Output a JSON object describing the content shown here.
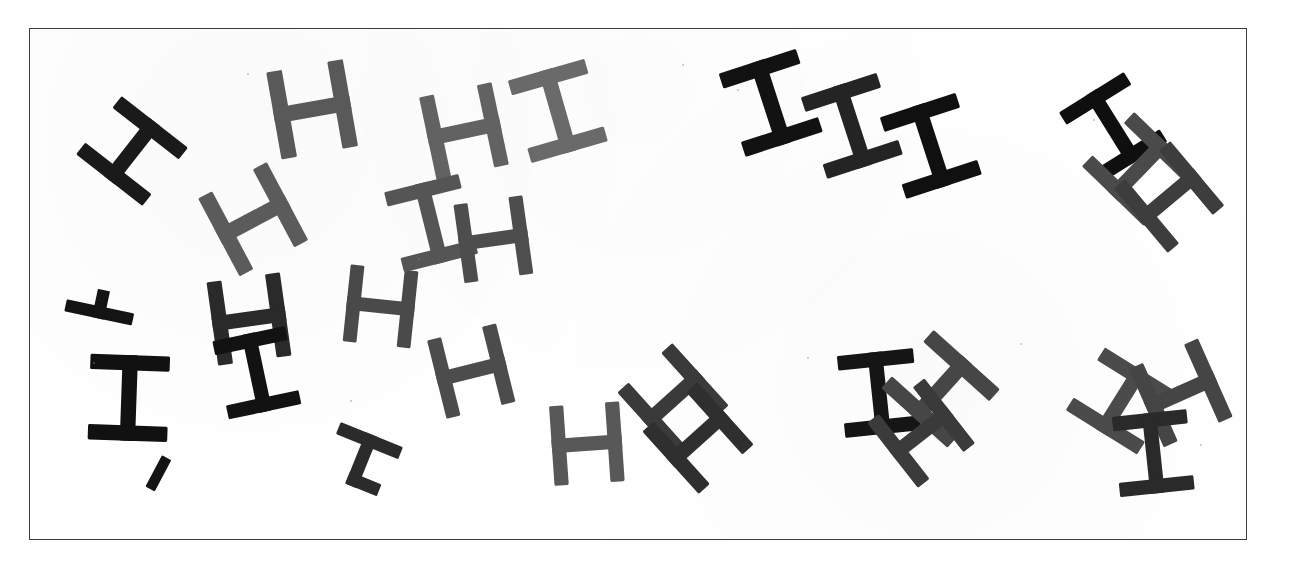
{
  "scene": {
    "title": "Scattered H letterform stimulus",
    "canvas_width": 1312,
    "canvas_height": 566,
    "background_color": "#ffffff",
    "frame": {
      "x": 29,
      "y": 28,
      "width": 1218,
      "height": 512,
      "border_color": "#3c3c3c",
      "border_width": 1.5,
      "fill_color": "#ffffff"
    },
    "ink_colors": {
      "black": "#1a1a1a",
      "dark": "#2e2e2e",
      "mid": "#4f4f4f",
      "gray": "#6a6a6a",
      "light_gray": "#7e7e7e"
    },
    "glyph_count": 27,
    "glyph_types": [
      "H",
      "I",
      "T",
      "fragment"
    ]
  },
  "glyphs": [
    {
      "id": 1,
      "char": "H",
      "x": 131,
      "y": 150,
      "rot": -52,
      "scale": 1.0,
      "color": "#1a1a1a",
      "label": "glyph-h-1"
    },
    {
      "id": 2,
      "char": "H",
      "x": 103,
      "y": 288,
      "rot": -78,
      "scale": 0.82,
      "color": "#141414",
      "label": "glyph-h-2",
      "clip": "right"
    },
    {
      "id": 3,
      "char": "I",
      "x": 128,
      "y": 397,
      "rot": 2,
      "scale": 1.02,
      "color": "#111111",
      "label": "glyph-i-3"
    },
    {
      "id": 4,
      "char": "fragment",
      "x": 157,
      "y": 482,
      "rot": 28,
      "scale": 0.7,
      "color": "#141414",
      "label": "glyph-fragment-4"
    },
    {
      "id": 5,
      "char": "H",
      "x": 252,
      "y": 218,
      "rot": -28,
      "scale": 1.05,
      "color": "#5c5c5c",
      "label": "glyph-h-5"
    },
    {
      "id": 6,
      "char": "H",
      "x": 248,
      "y": 318,
      "rot": -8,
      "scale": 1.0,
      "color": "#2a2a2a",
      "label": "glyph-h-6"
    },
    {
      "id": 7,
      "char": "I",
      "x": 256,
      "y": 372,
      "rot": -12,
      "scale": 0.95,
      "color": "#121212",
      "label": "glyph-i-7"
    },
    {
      "id": 8,
      "char": "T",
      "x": 358,
      "y": 466,
      "rot": 22,
      "scale": 0.86,
      "color": "#2b2b2b",
      "label": "glyph-t-8"
    },
    {
      "id": 9,
      "char": "H",
      "x": 380,
      "y": 305,
      "rot": 6,
      "scale": 0.92,
      "color": "#4a4a4a",
      "label": "glyph-h-9"
    },
    {
      "id": 10,
      "char": "H",
      "x": 311,
      "y": 108,
      "rot": -10,
      "scale": 1.05,
      "color": "#5a5a5a",
      "label": "glyph-h-10"
    },
    {
      "id": 11,
      "char": "H",
      "x": 463,
      "y": 130,
      "rot": -12,
      "scale": 1.0,
      "color": "#636363",
      "label": "glyph-h-11"
    },
    {
      "id": 12,
      "char": "I",
      "x": 557,
      "y": 110,
      "rot": -16,
      "scale": 1.02,
      "color": "#6b6b6b",
      "label": "glyph-i-12"
    },
    {
      "id": 13,
      "char": "I",
      "x": 430,
      "y": 222,
      "rot": -14,
      "scale": 0.98,
      "color": "#565656",
      "label": "glyph-i-13"
    },
    {
      "id": 14,
      "char": "H",
      "x": 492,
      "y": 238,
      "rot": -8,
      "scale": 0.94,
      "color": "#4e4e4e",
      "label": "glyph-h-14"
    },
    {
      "id": 15,
      "char": "H",
      "x": 470,
      "y": 370,
      "rot": -14,
      "scale": 0.96,
      "color": "#4c4c4c",
      "label": "glyph-h-15"
    },
    {
      "id": 16,
      "char": "H",
      "x": 586,
      "y": 443,
      "rot": -4,
      "scale": 0.95,
      "color": "#585858",
      "label": "glyph-h-16"
    },
    {
      "id": 17,
      "char": "H",
      "x": 672,
      "y": 398,
      "rot": -42,
      "scale": 1.0,
      "color": "#3a3a3a",
      "label": "glyph-h-17"
    },
    {
      "id": 18,
      "char": "H",
      "x": 697,
      "y": 437,
      "rot": -42,
      "scale": 1.0,
      "color": "#2f2f2f",
      "label": "glyph-h-18"
    },
    {
      "id": 19,
      "char": "I",
      "x": 770,
      "y": 102,
      "rot": -18,
      "scale": 1.04,
      "color": "#121212",
      "label": "glyph-i-19"
    },
    {
      "id": 20,
      "char": "I",
      "x": 851,
      "y": 125,
      "rot": -18,
      "scale": 1.02,
      "color": "#242424",
      "label": "glyph-i-20"
    },
    {
      "id": 21,
      "char": "I",
      "x": 930,
      "y": 145,
      "rot": -18,
      "scale": 1.02,
      "color": "#101010",
      "label": "glyph-i-21"
    },
    {
      "id": 22,
      "char": "I",
      "x": 878,
      "y": 392,
      "rot": -6,
      "scale": 0.98,
      "color": "#151515",
      "label": "glyph-i-22"
    },
    {
      "id": 23,
      "char": "H",
      "x": 940,
      "y": 388,
      "rot": -48,
      "scale": 1.06,
      "color": "#474747",
      "label": "glyph-h-23"
    },
    {
      "id": 24,
      "char": "H",
      "x": 920,
      "y": 432,
      "rot": -38,
      "scale": 0.98,
      "color": "#3b3b3b",
      "label": "glyph-h-24"
    },
    {
      "id": 25,
      "char": "I",
      "x": 1112,
      "y": 126,
      "rot": -32,
      "scale": 0.98,
      "color": "#0f0f0f",
      "label": "glyph-i-25"
    },
    {
      "id": 26,
      "char": "H",
      "x": 1138,
      "y": 168,
      "rot": -46,
      "scale": 1.02,
      "color": "#4a4a4a",
      "label": "glyph-h-26"
    },
    {
      "id": 27,
      "char": "H",
      "x": 1168,
      "y": 196,
      "rot": -40,
      "scale": 1.0,
      "color": "#3d3d3d",
      "label": "glyph-h-27"
    },
    {
      "id": 28,
      "char": "H",
      "x": 1120,
      "y": 400,
      "rot": -58,
      "scale": 1.0,
      "color": "#4b4b4b",
      "label": "glyph-h-28"
    },
    {
      "id": 29,
      "char": "H",
      "x": 1180,
      "y": 392,
      "rot": -24,
      "scale": 1.02,
      "color": "#454545",
      "label": "glyph-h-29"
    },
    {
      "id": 30,
      "char": "I",
      "x": 1152,
      "y": 452,
      "rot": -6,
      "scale": 0.96,
      "color": "#2a2a2a",
      "label": "glyph-i-30"
    }
  ],
  "specks": [
    {
      "x": 246,
      "y": 72,
      "d": 2
    },
    {
      "x": 681,
      "y": 63,
      "d": 2
    },
    {
      "x": 736,
      "y": 88,
      "d": 2
    },
    {
      "x": 1092,
      "y": 118,
      "d": 2
    },
    {
      "x": 92,
      "y": 361,
      "d": 2
    },
    {
      "x": 417,
      "y": 257,
      "d": 2
    },
    {
      "x": 806,
      "y": 356,
      "d": 2
    },
    {
      "x": 1019,
      "y": 342,
      "d": 2
    },
    {
      "x": 1199,
      "y": 443,
      "d": 2
    },
    {
      "x": 349,
      "y": 399,
      "d": 2
    }
  ]
}
